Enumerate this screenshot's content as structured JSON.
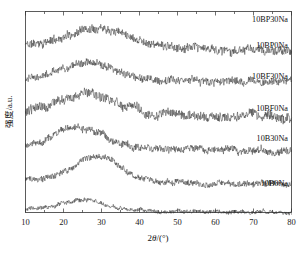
{
  "chart_data": {
    "type": "line",
    "title": "",
    "xlabel": "2θ/(°)",
    "ylabel": "强度/a.u.",
    "xlim": [
      10,
      80
    ],
    "ylim": [
      0,
      6
    ],
    "grid": false,
    "legend_position": "inline-right",
    "xticks": [
      10,
      20,
      30,
      40,
      50,
      60,
      70,
      80
    ],
    "xtick_labels": [
      "10",
      "20",
      "30",
      "40",
      "50",
      "60",
      "70",
      "80"
    ],
    "xminor_step": 5,
    "yticks": [],
    "ytick_labels": [],
    "series": [
      {
        "name": "10BP30Na",
        "label": "10BP30Na",
        "offset": 5.0,
        "hump_center": 30,
        "hump_width": 11,
        "hump_height": 0.62,
        "noise_amplitude": 0.115,
        "baseline_tilt": -0.02,
        "seed": 11
      },
      {
        "name": "10BP0Na",
        "label": "10BP0Na",
        "offset": 4.0,
        "hump_center": 26,
        "hump_width": 10,
        "hump_height": 0.5,
        "noise_amplitude": 0.105,
        "baseline_tilt": -0.01,
        "seed": 27
      },
      {
        "name": "10BF30Na",
        "label": "10BF30Na",
        "offset": 3.0,
        "hump_center": 27,
        "hump_width": 10,
        "hump_height": 0.56,
        "noise_amplitude": 0.13,
        "baseline_tilt": -0.015,
        "seed": 43
      },
      {
        "name": "10BF0Na",
        "label": "10BF0Na",
        "offset": 2.0,
        "hump_center": 24,
        "hump_width": 8.5,
        "hump_height": 0.6,
        "noise_amplitude": 0.1,
        "baseline_tilt": -0.02,
        "seed": 59
      },
      {
        "name": "10B30Na",
        "label": "10B30Na",
        "offset": 1.0,
        "hump_center": 29,
        "hump_width": 8,
        "hump_height": 0.72,
        "noise_amplitude": 0.085,
        "baseline_tilt": -0.015,
        "seed": 71
      },
      {
        "name": "10B0Na",
        "label": "10B0Na",
        "offset": 0.08,
        "hump_center": 25,
        "hump_width": 9,
        "hump_height": 0.3,
        "noise_amplitude": 0.055,
        "baseline_tilt": -0.008,
        "seed": 97
      }
    ]
  },
  "axis": {
    "x_title_prefix": "2",
    "x_title_theta": "θ",
    "x_title_suffix": "/(°)",
    "y_title": "强度/a.u."
  }
}
